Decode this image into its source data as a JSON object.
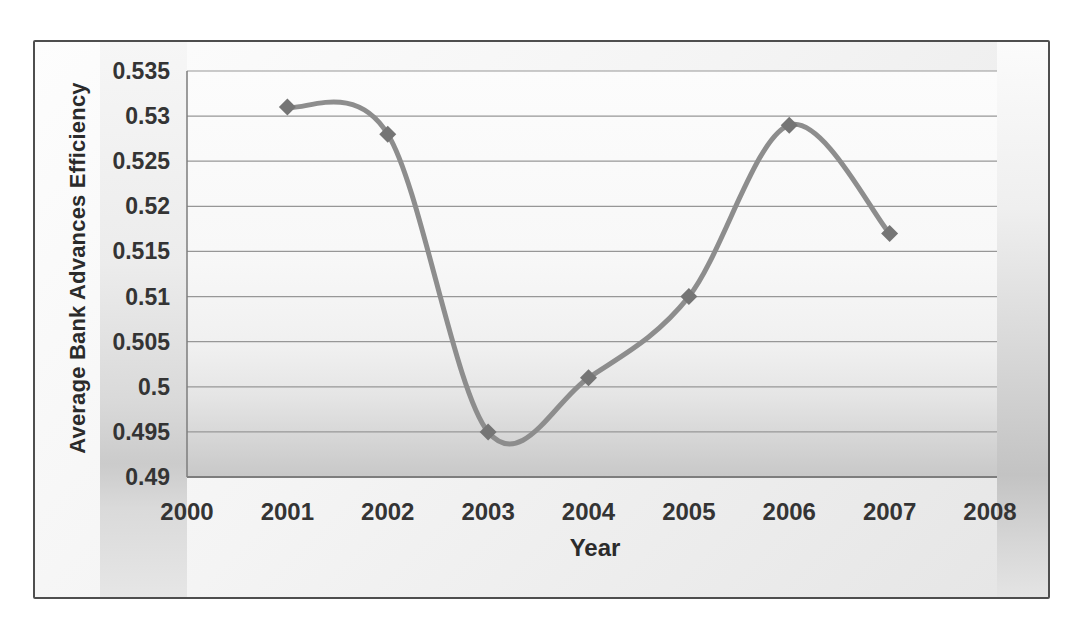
{
  "chart_data": {
    "type": "line",
    "title": "",
    "xlabel": "Year",
    "ylabel": "Average Bank Advances Efficiency",
    "x": [
      2001,
      2002,
      2003,
      2004,
      2005,
      2006,
      2007
    ],
    "values": [
      0.531,
      0.528,
      0.495,
      0.501,
      0.51,
      0.529,
      0.517
    ],
    "xlim": [
      2000,
      2008
    ],
    "ylim": [
      0.49,
      0.535
    ],
    "x_ticks": [
      2000,
      2001,
      2002,
      2003,
      2004,
      2005,
      2006,
      2007,
      2008
    ],
    "x_tick_labels": [
      "2000",
      "2001",
      "2002",
      "2003",
      "2004",
      "2005",
      "2006",
      "2007",
      "2008"
    ],
    "y_ticks": [
      0.49,
      0.495,
      0.5,
      0.505,
      0.51,
      0.515,
      0.52,
      0.525,
      0.53,
      0.535
    ],
    "y_tick_labels": [
      "0.49",
      "0.495",
      "0.5",
      "0.505",
      "0.51",
      "0.515",
      "0.52",
      "0.525",
      "0.53",
      "0.535"
    ],
    "grid": true,
    "legend": "none",
    "smooth": true,
    "marker": "diamond",
    "colors": {
      "line": "#8d8d8d",
      "marker": "#757575",
      "gridline": "#979797",
      "axis_line": "#7d7d7d",
      "tick_text": "#343434",
      "frame_border": "#4e4e4e"
    }
  }
}
